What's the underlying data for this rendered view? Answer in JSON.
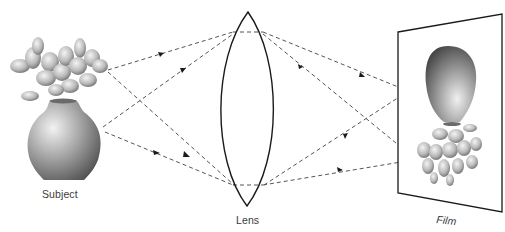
{
  "diagram": {
    "labels": {
      "subject": "Subject",
      "lens": "Lens",
      "film": "Film"
    },
    "colors": {
      "background": "#ffffff",
      "lens_stroke": "#1a1a1a",
      "ray_stroke": "#555555",
      "arrow_fill": "#1a1a1a",
      "film_stroke": "#1a1a1a",
      "label_text": "#3a3a3a",
      "vase_light": "#e6e6e6",
      "vase_dark": "#555555"
    },
    "elements": [
      {
        "id": "subject",
        "kind": "vase-with-flowers",
        "orientation": "upright"
      },
      {
        "id": "lens",
        "kind": "biconvex-lens"
      },
      {
        "id": "film",
        "kind": "film-plane",
        "image_orientation": "inverted"
      }
    ],
    "rays": [
      {
        "from": "subject-top",
        "to": "lens-top",
        "continues_to": "film-lower"
      },
      {
        "from": "subject-top",
        "to": "lens-bottom",
        "continues_to": "film-lower"
      },
      {
        "from": "subject-bottom",
        "to": "lens-top",
        "continues_to": "film-upper"
      },
      {
        "from": "subject-bottom",
        "to": "lens-bottom",
        "continues_to": "film-upper"
      }
    ]
  }
}
